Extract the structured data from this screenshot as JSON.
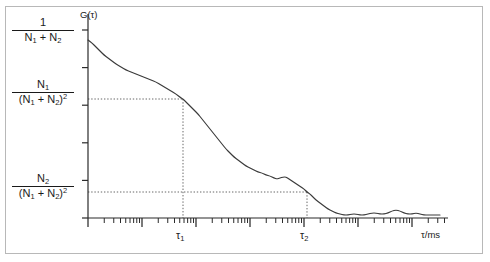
{
  "figure": {
    "title": "",
    "background": "#ffffff",
    "frame_color": "#b8b8b8",
    "curve_color": "#3a3a3a",
    "axis_color": "#2b2b2b",
    "guide_color": "#555555"
  },
  "labels": {
    "y_axis_symbol": "G(τ)",
    "x_axis_title": "τ/ms",
    "tau1": "τ",
    "tau1_sub": "1",
    "tau2": "τ",
    "tau2_sub": "2",
    "y_top": {
      "numerator": "1",
      "denominator_pre": "N",
      "denominator_sub1": "1",
      "denominator_mid": " + N",
      "denominator_sub2": "2",
      "denominator_sup": ""
    },
    "y_mid": {
      "numerator": "N",
      "numerator_sub": "1",
      "denominator": "(N",
      "denominator_sub1": "1",
      "denominator_mid": " + N",
      "denominator_sub2": "2",
      "denominator_close": ")",
      "denominator_sup": "2"
    },
    "y_bot": {
      "numerator": "N",
      "numerator_sub": "2",
      "denominator": "(N",
      "denominator_sub1": "1",
      "denominator_mid": " + N",
      "denominator_sub2": "2",
      "denominator_close": ")",
      "denominator_sup": "2"
    }
  },
  "chart_data": {
    "type": "line",
    "title": "",
    "xlabel": "τ/ms",
    "ylabel": "G(τ)",
    "xscale": "log",
    "yscale": "linear",
    "grid": false,
    "legend": null,
    "x_axis": {
      "type": "log",
      "decade_count": 6,
      "minor_ticks_per_decade": [
        2,
        3,
        4,
        5,
        6,
        7,
        8,
        9
      ],
      "major_tick_length_px": 9,
      "minor_tick_length_px": 5,
      "tick_labels_shown": false,
      "decade_positions_px": [
        88,
        142,
        196,
        250,
        304,
        358,
        412
      ]
    },
    "y_axis": {
      "type": "linear",
      "tick_count": 6,
      "tick_labels_shown": false,
      "labeled_levels": [
        {
          "label": "1/(N1 + N2)",
          "value": 1.0,
          "y_px": 30
        },
        {
          "label": "N1/(N1 + N2)^2",
          "value": 0.62,
          "y_px": 99
        },
        {
          "label": "N2/(N1 + N2)^2",
          "value": 0.165,
          "y_px": 192
        }
      ]
    },
    "markers": [
      {
        "name": "tau_1",
        "label": "τ₁",
        "x_px": 183,
        "y_px": 99,
        "guide": "dotted horizontal from y-axis plus dotted vertical down to x-axis"
      },
      {
        "name": "tau_2",
        "label": "τ₂",
        "x_px": 307,
        "y_px": 192,
        "guide": "dotted horizontal from y-axis plus dotted vertical down to x-axis"
      }
    ],
    "series": [
      {
        "name": "G(tau)",
        "color": "#3a3a3a",
        "points_px": [
          [
            88,
            40
          ],
          [
            92,
            43
          ],
          [
            96,
            47
          ],
          [
            100,
            51
          ],
          [
            104,
            55
          ],
          [
            108,
            58
          ],
          [
            112,
            61
          ],
          [
            116,
            64
          ],
          [
            121,
            67
          ],
          [
            126,
            70
          ],
          [
            131,
            72
          ],
          [
            136,
            74
          ],
          [
            141,
            76
          ],
          [
            146,
            78
          ],
          [
            151,
            80
          ],
          [
            156,
            82
          ],
          [
            161,
            85
          ],
          [
            166,
            88
          ],
          [
            171,
            91
          ],
          [
            176,
            94
          ],
          [
            181,
            98
          ],
          [
            183,
            99
          ],
          [
            186,
            102
          ],
          [
            190,
            106
          ],
          [
            194,
            110
          ],
          [
            198,
            114
          ],
          [
            202,
            119
          ],
          [
            206,
            124
          ],
          [
            210,
            129
          ],
          [
            214,
            134
          ],
          [
            218,
            139
          ],
          [
            222,
            144
          ],
          [
            226,
            149
          ],
          [
            230,
            153
          ],
          [
            234,
            157
          ],
          [
            238,
            160
          ],
          [
            242,
            163
          ],
          [
            246,
            166
          ],
          [
            250,
            168
          ],
          [
            254,
            170
          ],
          [
            258,
            172
          ],
          [
            262,
            173
          ],
          [
            266,
            175
          ],
          [
            270,
            176
          ],
          [
            274,
            178
          ],
          [
            277,
            179
          ],
          [
            280,
            178
          ],
          [
            283,
            177
          ],
          [
            286,
            177
          ],
          [
            289,
            179
          ],
          [
            292,
            181
          ],
          [
            295,
            183
          ],
          [
            298,
            185
          ],
          [
            301,
            187
          ],
          [
            304,
            189
          ],
          [
            307,
            192
          ],
          [
            310,
            194
          ],
          [
            313,
            197
          ],
          [
            316,
            200
          ],
          [
            320,
            203
          ],
          [
            324,
            206
          ],
          [
            328,
            209
          ],
          [
            332,
            211
          ],
          [
            336,
            213
          ],
          [
            340,
            214
          ],
          [
            344,
            215
          ],
          [
            348,
            215
          ],
          [
            352,
            214
          ],
          [
            356,
            214
          ],
          [
            360,
            215
          ],
          [
            364,
            215
          ],
          [
            368,
            214
          ],
          [
            372,
            213
          ],
          [
            376,
            213
          ],
          [
            380,
            214
          ],
          [
            384,
            214
          ],
          [
            388,
            213
          ],
          [
            392,
            211
          ],
          [
            396,
            210
          ],
          [
            400,
            211
          ],
          [
            404,
            213
          ],
          [
            408,
            214
          ],
          [
            412,
            214
          ],
          [
            416,
            213
          ],
          [
            420,
            214
          ],
          [
            424,
            215
          ],
          [
            428,
            215
          ],
          [
            432,
            215
          ],
          [
            436,
            215
          ],
          [
            440,
            215
          ]
        ]
      }
    ]
  }
}
